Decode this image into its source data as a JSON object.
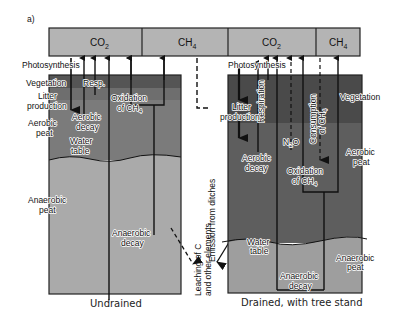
{
  "panel_label": "a)",
  "colors": {
    "top_bar": "#b4b4b4",
    "vegetation_left": "#555555",
    "litter_left": "#6e6e6e",
    "aerobic_left": "#7b7b7b",
    "anaerobic_left": "#aaaaaa",
    "drained_vegetation": "#4a4a4a",
    "drained_aerobic": "#5e5e5e",
    "anaerobic_right": "#9e9e9e"
  },
  "top_bar": {
    "segments": [
      {
        "label": "CO",
        "sub": "2"
      },
      {
        "label": "CH",
        "sub": "4"
      },
      {
        "label": "CO",
        "sub": "2"
      },
      {
        "label": "CH",
        "sub": "4"
      }
    ]
  },
  "undrained": {
    "caption": "Undrained",
    "labels": {
      "photosynthesis": "Photosynthesis",
      "vegetation": "Vegetation",
      "litter_1": "Litter",
      "litter_2": "production",
      "aerobic_peat_1": "Aerobic",
      "aerobic_peat_2": "peat",
      "anaerobic_peat_1": "Anaerobic",
      "anaerobic_peat_2": "peat",
      "resp": "Resp.",
      "aerobic_decay_1": "Aerobic",
      "aerobic_decay_2": "decay",
      "water_table_1": "Water",
      "water_table_2": "table",
      "oxidation_1": "Oxidation",
      "oxidation_2": "of CH",
      "oxidation_sub": "4",
      "anaerobic_decay_1": "Anaerobic",
      "anaerobic_decay_2": "decay"
    }
  },
  "middle": {
    "emission_from_ditches": "Emission from ditches",
    "leaching_1": "Leaching of C",
    "leaching_2": "and other elements"
  },
  "drained": {
    "caption": "Drained, with tree stand",
    "labels": {
      "photosynthesis": "Photosynthesis",
      "litter_1": "Litter",
      "litter_2": "production",
      "respiration": "Respiration",
      "vegetation": "Vegetation",
      "n2o": "N",
      "n2o_sub": "2",
      "n2o_tail": "O",
      "consumption_1": "Consumption",
      "consumption_2": "of CH",
      "consumption_sub": "4",
      "aerobic_decay_1": "Aerobic",
      "aerobic_decay_2": "decay",
      "aerobic_peat_1": "Aerobic",
      "aerobic_peat_2": "peat",
      "oxidation_1": "Oxidation",
      "oxidation_2": "of CH",
      "oxidation_sub": "4",
      "water_table_1": "Water",
      "water_table_2": "table",
      "anaerobic_peat_1": "Anaerobic",
      "anaerobic_peat_2": "peat",
      "anaerobic_decay_1": "Anaerobic",
      "anaerobic_decay_2": "decay"
    }
  }
}
